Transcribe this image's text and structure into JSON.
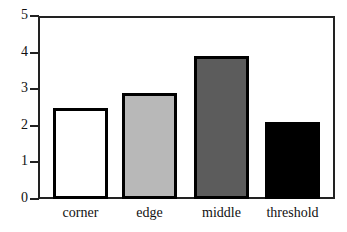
{
  "chart_data": {
    "type": "bar",
    "title": "",
    "xlabel": "",
    "ylabel": "",
    "ylim": [
      0,
      5
    ],
    "yticks": [
      0,
      1,
      2,
      3,
      4,
      5
    ],
    "categories": [
      "corner",
      "edge",
      "middle",
      "threshold"
    ],
    "values": [
      2.5,
      2.9,
      3.9,
      2.1
    ],
    "bar_colors": [
      "#ffffff",
      "#b8b8b8",
      "#5c5c5c",
      "#000000"
    ],
    "grid": false,
    "legend": null
  },
  "axis": {
    "y_tick_labels": [
      "0",
      "1",
      "2",
      "3",
      "4",
      "5"
    ]
  }
}
